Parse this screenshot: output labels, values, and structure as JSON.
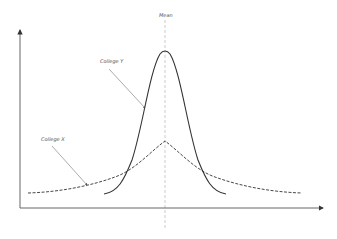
{
  "diagram": {
    "mean_label": "Mean",
    "series": [
      {
        "name": "College Y",
        "style": "solid",
        "label": "College Y"
      },
      {
        "name": "College X",
        "style": "dashed",
        "label": "College X"
      }
    ],
    "colors": {
      "curve": "#333333",
      "axis": "#555555",
      "mean_line": "#aaaaaa",
      "pointer": "#888888"
    }
  }
}
